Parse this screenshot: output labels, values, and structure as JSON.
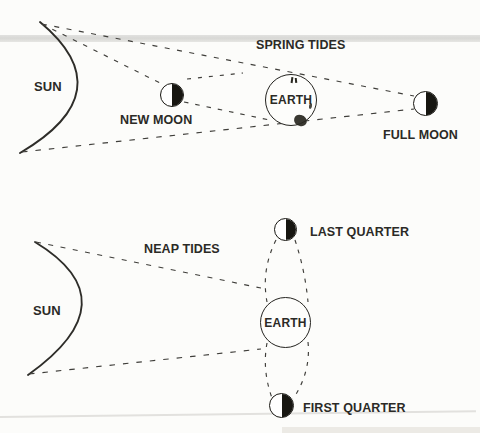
{
  "figure": {
    "spring": {
      "title": "SPRING TIDES",
      "sun": "SUN",
      "new_moon": "NEW MOON",
      "earth": "EARTH",
      "full_moon": "FULL MOON"
    },
    "neap": {
      "title": "NEAP TIDES",
      "sun": "SUN",
      "earth": "EARTH",
      "last_quarter": "LAST QUARTER",
      "first_quarter": "FIRST QUARTER"
    },
    "colors": {
      "ink": "#2b2a26",
      "dash_line": "#3f3e3a",
      "moon_fill": "#171611",
      "scan_band": "#d2d2cf",
      "background": "#fcfcfa"
    }
  }
}
